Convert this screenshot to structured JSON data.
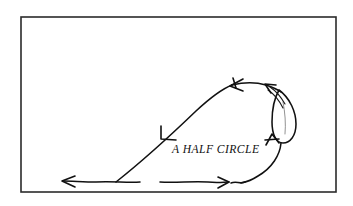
{
  "figure": {
    "caption": "A HALF CIRCLE",
    "frame": {
      "x": 21,
      "y": 17,
      "width": 315,
      "height": 175,
      "stroke_color": "#2b2b2b"
    },
    "ink_color": "#111111",
    "background_color": "#ffffff",
    "caption_position": {
      "x": 172,
      "y": 153
    },
    "strokes": [
      {
        "name": "bottom-left-horizontal-stroke",
        "description": "horizontal line along bottom running leftward to an arrow tip",
        "path": "M 140 182 C 128 183 112 181 96 182 C 84 182 72 181 63 181"
      },
      {
        "name": "diagonal-rising-stroke",
        "description": "long diagonal rising from lower-left up to the apex of the loop",
        "path": "M 116 182 C 140 163 170 136 196 111 C 210 98 222 89 232 85"
      },
      {
        "name": "apex-curve-stroke",
        "description": "curve across the top from apex rightward to the narrow loop",
        "path": "M 232 85 C 244 82 256 82 266 85 C 272 87 277 89 281 92"
      },
      {
        "name": "narrow-loop-stroke",
        "description": "long narrow teardrop loop on the right side",
        "path": "M 279 90 C 290 98 296 112 296 124 C 296 136 290 143 283 143 C 276 143 272 134 272 122 C 272 109 275 97 279 90 Z"
      },
      {
        "name": "loop-inner-faint-stroke",
        "description": "faint inner line inside the narrow loop",
        "path": "M 283 102 C 285 112 286 124 285 134"
      },
      {
        "name": "loop-entry-parallel-stroke-a",
        "description": "secondary parallel stroke entering the loop at top",
        "path": "M 270 87 C 276 91 281 97 285 104"
      },
      {
        "name": "loop-entry-parallel-stroke-b",
        "description": "third parallel stroke entering the loop at top",
        "path": "M 268 90 C 274 94 279 100 283 108"
      },
      {
        "name": "loop-exit-descending-stroke",
        "description": "stroke descending from the loop bottom toward bottom-right",
        "path": "M 281 143 C 280 155 272 168 258 176 C 252 180 246 182 241 183"
      },
      {
        "name": "bottom-middle-horizontal-stroke",
        "description": "horizontal line along bottom running rightward to an arrow tip",
        "path": "M 160 182 C 176 183 192 181 208 182 C 218 183 224 182 229 182"
      },
      {
        "name": "bottom-right-link-stroke",
        "description": "short wavy link between bottom arrow and descending curve",
        "path": "M 231 183 C 236 181 240 184 245 182"
      }
    ],
    "arrowheads": [
      {
        "name": "arrowhead-bottom-left",
        "direction": "left",
        "tip": {
          "x": 62,
          "y": 181
        },
        "path": "M 75 176 L 62 181 L 75 187"
      },
      {
        "name": "arrowhead-bottom-middle",
        "direction": "right",
        "tip": {
          "x": 229,
          "y": 182
        },
        "path": "M 218 177 L 229 182 L 218 188"
      },
      {
        "name": "arrowhead-diagonal",
        "direction": "down-left",
        "tip": {
          "x": 161,
          "y": 139
        },
        "path": "M 161 126 L 161 139 L 176 140"
      },
      {
        "name": "arrowhead-apex",
        "direction": "left",
        "tip": {
          "x": 230,
          "y": 86
        },
        "path": "M 243 79 L 230 86 L 243 91"
      },
      {
        "name": "arrowhead-apex-tick",
        "direction": "up",
        "tip": {
          "x": 233,
          "y": 78
        },
        "path": "M 233 78 L 236 88"
      },
      {
        "name": "arrowhead-loop-top",
        "direction": "up-left",
        "tip": {
          "x": 265,
          "y": 84
        },
        "path": "M 276 85 L 265 84 L 271 93"
      },
      {
        "name": "arrowhead-loop-bottom",
        "direction": "up",
        "tip": {
          "x": 272,
          "y": 134
        },
        "path": "M 266 145 L 272 134 L 279 143"
      },
      {
        "name": "arrowhead-loop-bottom-tick",
        "direction": "cross",
        "tip": {
          "x": 265,
          "y": 140
        },
        "path": "M 265 140 L 279 139"
      }
    ]
  }
}
